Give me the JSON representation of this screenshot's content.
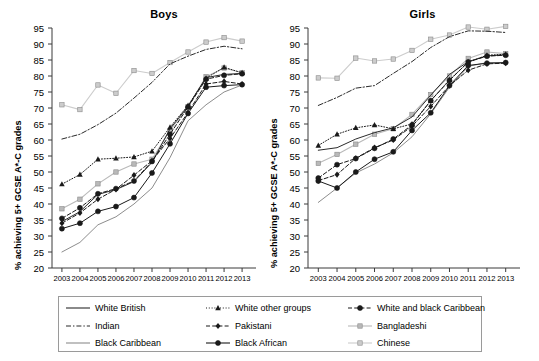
{
  "figure": {
    "panels": [
      "Boys",
      "Girls"
    ],
    "ylabel": "% achieving 5+ GCSE A*-C grades",
    "ytick_labels": [
      "95",
      "90",
      "85",
      "80",
      "75",
      "70",
      "65",
      "60",
      "55",
      "50",
      "45",
      "40",
      "35",
      "30",
      "25",
      "20"
    ],
    "xtick_labels": [
      "2003",
      "2004",
      "2005",
      "2006",
      "2007",
      "2008",
      "2009",
      "2010",
      "2011",
      "2012",
      "2013"
    ]
  },
  "legend": {
    "items": [
      {
        "label": "White British",
        "style": "solid",
        "marker": "none",
        "color": "#2b2b2b"
      },
      {
        "label": "White other groups",
        "style": "dotted",
        "marker": "triangle",
        "color": "#1a1a1a"
      },
      {
        "label": "White and black Caribbean",
        "style": "dashed",
        "marker": "circle",
        "color": "#1a1a1a"
      },
      {
        "label": "Indian",
        "style": "dashdot",
        "marker": "none",
        "color": "#2b2b2b"
      },
      {
        "label": "Pakistani",
        "style": "dashed",
        "marker": "diamond",
        "color": "#1a1a1a"
      },
      {
        "label": "Bangladeshi",
        "style": "solid",
        "marker": "square",
        "color": "#b9b9b9"
      },
      {
        "label": "Black Caribbean",
        "style": "solid",
        "marker": "none",
        "color": "#8d8d8d"
      },
      {
        "label": "Black African",
        "style": "solid",
        "marker": "circle",
        "color": "#1a1a1a"
      },
      {
        "label": "Chinese",
        "style": "solid",
        "marker": "square",
        "color": "#cccccc"
      }
    ]
  },
  "chart_data": [
    {
      "type": "line",
      "title": "Boys",
      "xlabel": "",
      "ylabel": "% achieving 5+ GCSE A*-C grades",
      "x": [
        2003,
        2004,
        2005,
        2006,
        2007,
        2008,
        2009,
        2010,
        2011,
        2012,
        2013
      ],
      "ylim": [
        20,
        95
      ],
      "ytick_step": 5,
      "grid": false,
      "legend_position": "below",
      "series": [
        {
          "name": "White British",
          "values": [
            34.5,
            37.6,
            43.0,
            44.5,
            47.0,
            53.0,
            63.5,
            70.5,
            79.5,
            80.5,
            80.8
          ]
        },
        {
          "name": "White other groups",
          "values": [
            46.2,
            49.2,
            54.0,
            54.3,
            54.7,
            56.5,
            64.0,
            70.8,
            79.3,
            82.7,
            81.0
          ]
        },
        {
          "name": "White and black Caribbean",
          "values": [
            35.5,
            38.8,
            43.2,
            44.8,
            47.2,
            53.3,
            61.8,
            70.3,
            79.0,
            80.2,
            80.7
          ]
        },
        {
          "name": "Indian",
          "values": [
            60.3,
            61.8,
            64.8,
            68.4,
            73.1,
            78.0,
            83.8,
            86.2,
            88.3,
            89.3,
            88.5
          ]
        },
        {
          "name": "Pakistani",
          "values": [
            34.0,
            37.2,
            41.5,
            44.6,
            49.0,
            53.5,
            60.5,
            68.6,
            77.5,
            78.3,
            77.5
          ]
        },
        {
          "name": "Bangladeshi",
          "values": [
            38.5,
            41.5,
            46.3,
            50.0,
            52.5,
            54.0,
            63.0,
            70.4,
            79.8,
            82.5,
            81.0
          ]
        },
        {
          "name": "Black Caribbean",
          "values": [
            25.0,
            28.0,
            33.5,
            36.0,
            40.0,
            45.0,
            54.5,
            66.0,
            71.0,
            75.0,
            77.2
          ]
        },
        {
          "name": "Black African",
          "values": [
            32.3,
            34.0,
            37.7,
            39.2,
            42.0,
            49.7,
            58.8,
            68.3,
            76.5,
            77.0,
            77.3
          ]
        },
        {
          "name": "Chinese",
          "values": [
            71.0,
            69.5,
            77.2,
            74.6,
            81.7,
            80.8,
            84.2,
            87.5,
            90.6,
            92.0,
            90.9
          ]
        }
      ]
    },
    {
      "type": "line",
      "title": "Girls",
      "xlabel": "",
      "ylabel": "% achieving 5+ GCSE A*-C grades",
      "x": [
        2003,
        2004,
        2005,
        2006,
        2007,
        2008,
        2009,
        2010,
        2011,
        2012,
        2013
      ],
      "ylim": [
        20,
        95
      ],
      "ytick_step": 5,
      "grid": false,
      "legend_position": "below",
      "series": [
        {
          "name": "White British",
          "values": [
            56.8,
            57.6,
            60.3,
            62.3,
            63.8,
            67.2,
            74.0,
            80.5,
            84.5,
            86.3,
            86.6
          ]
        },
        {
          "name": "White other groups",
          "values": [
            58.3,
            61.8,
            63.8,
            64.7,
            63.5,
            65.0,
            72.3,
            78.8,
            84.3,
            86.5,
            86.8
          ]
        },
        {
          "name": "White and black Caribbean",
          "values": [
            48.1,
            52.3,
            54.2,
            57.4,
            60.3,
            64.7,
            72.3,
            78.6,
            84.4,
            86.2,
            86.5
          ]
        },
        {
          "name": "Indian",
          "values": [
            70.8,
            73.3,
            76.2,
            77.0,
            80.8,
            84.5,
            88.9,
            92.3,
            94.1,
            94.0,
            93.6
          ]
        },
        {
          "name": "Pakistani",
          "values": [
            47.3,
            49.2,
            54.3,
            57.6,
            60.0,
            64.3,
            70.5,
            77.0,
            81.8,
            83.8,
            84.0
          ]
        },
        {
          "name": "Bangladeshi",
          "values": [
            52.7,
            55.5,
            58.7,
            61.8,
            63.5,
            68.0,
            74.2,
            80.0,
            85.5,
            87.5,
            87.0
          ]
        },
        {
          "name": "Black Caribbean",
          "values": [
            40.5,
            45.0,
            49.7,
            52.5,
            56.0,
            61.0,
            68.2,
            76.5,
            83.0,
            84.2,
            84.0
          ]
        },
        {
          "name": "Black African",
          "values": [
            47.2,
            45.0,
            50.0,
            54.0,
            56.3,
            63.0,
            68.5,
            77.0,
            83.3,
            84.0,
            84.2
          ]
        },
        {
          "name": "Chinese",
          "values": [
            79.4,
            79.3,
            85.6,
            84.7,
            85.3,
            88.0,
            91.5,
            92.8,
            95.3,
            94.6,
            95.5
          ]
        }
      ]
    }
  ]
}
